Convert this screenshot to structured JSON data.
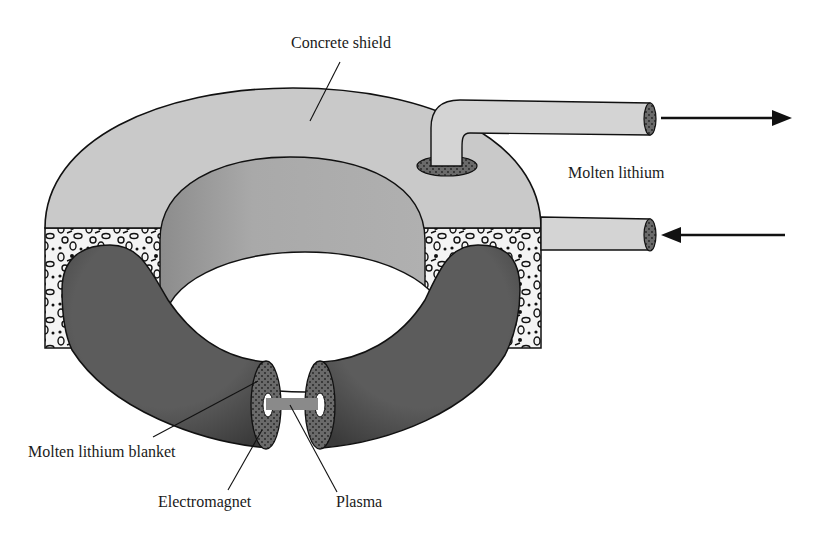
{
  "diagram": {
    "type": "fusion-reactor-cutaway",
    "labels": {
      "concrete_shield": "Concrete shield",
      "molten_lithium": "Molten lithium",
      "molten_lithium_blanket": "Molten lithium blanket",
      "electromagnet": "Electromagnet",
      "plasma": "Plasma"
    },
    "arrows": {
      "outflow": "right",
      "inflow": "left"
    },
    "colors": {
      "shield": "#c8c8c8",
      "inner_wall": "#a9a9a9",
      "torus": "#5a5a5a",
      "plasma": "#8a8a8a",
      "outline": "#111111",
      "concrete_aggregate_bg": "#f2f2f2"
    }
  }
}
